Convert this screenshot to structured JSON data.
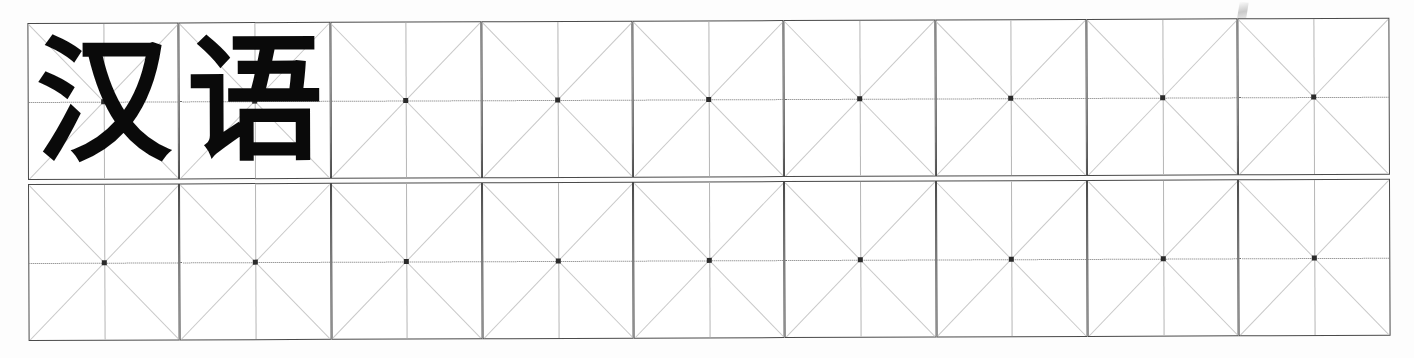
{
  "page": {
    "background_color": "#ffffff",
    "width": 1414,
    "height": 358
  },
  "grid": {
    "type": "mizige-character-practice-grid",
    "columns": 9,
    "rows": 2,
    "total_cells": 18,
    "cell_width": 151,
    "cell_height": 157,
    "border_color": "#4a4a4a",
    "diagonal_color": "#c9c9c9",
    "midline_horizontal_color": "#6f6f6f",
    "midline_vertical_color": "#b5b5b5",
    "center_dot_color": "#2b2b2b",
    "glyph_color": "#0a0a0a"
  },
  "cells": {
    "row1": [
      {
        "index": 1,
        "char": "汉"
      },
      {
        "index": 2,
        "char": "语"
      },
      {
        "index": 3,
        "char": ""
      },
      {
        "index": 4,
        "char": ""
      },
      {
        "index": 5,
        "char": ""
      },
      {
        "index": 6,
        "char": ""
      },
      {
        "index": 7,
        "char": ""
      },
      {
        "index": 8,
        "char": ""
      },
      {
        "index": 9,
        "char": ""
      }
    ],
    "row2": [
      {
        "index": 10,
        "char": ""
      },
      {
        "index": 11,
        "char": ""
      },
      {
        "index": 12,
        "char": ""
      },
      {
        "index": 13,
        "char": ""
      },
      {
        "index": 14,
        "char": ""
      },
      {
        "index": 15,
        "char": ""
      },
      {
        "index": 16,
        "char": ""
      },
      {
        "index": 17,
        "char": ""
      },
      {
        "index": 18,
        "char": ""
      }
    ]
  },
  "artifacts": {
    "scan_speck_label": "scan-speck"
  }
}
